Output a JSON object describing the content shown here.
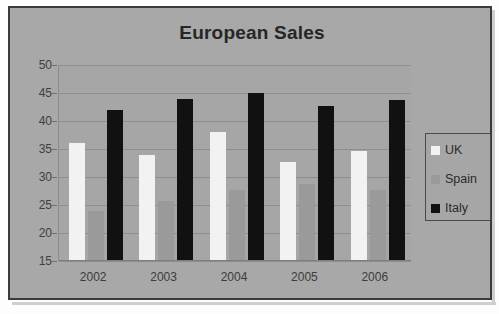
{
  "chart_data": {
    "type": "bar",
    "title": "European Sales",
    "xlabel": "",
    "ylabel": "",
    "categories": [
      "2002",
      "2003",
      "2004",
      "2005",
      "2006"
    ],
    "series": [
      {
        "name": "UK",
        "color": "#f2f2f2",
        "values": [
          36.0,
          34.0,
          38.0,
          32.7,
          34.7
        ]
      },
      {
        "name": "Spain",
        "color": "#9a9a9a",
        "values": [
          24.0,
          25.7,
          27.6,
          28.7,
          27.6
        ]
      },
      {
        "name": "Italy",
        "color": "#111111",
        "values": [
          42.0,
          44.0,
          45.0,
          42.7,
          43.7
        ]
      }
    ],
    "ylim": [
      15,
      50
    ],
    "ytick_step": 5,
    "ytick_labels": [
      "50",
      "45",
      "40",
      "35",
      "30",
      "25",
      "20",
      "15"
    ],
    "grid": true,
    "legend_position": "right",
    "plot_background": "#a6a6a6",
    "chart_background": "#a8a8a8",
    "gridline_color": "#8e8e8e",
    "title_color": "#262626",
    "border_color": "#3a3a3a"
  },
  "legend": {
    "entries": [
      {
        "label": "UK"
      },
      {
        "label": "Spain"
      },
      {
        "label": "Italy"
      }
    ]
  }
}
